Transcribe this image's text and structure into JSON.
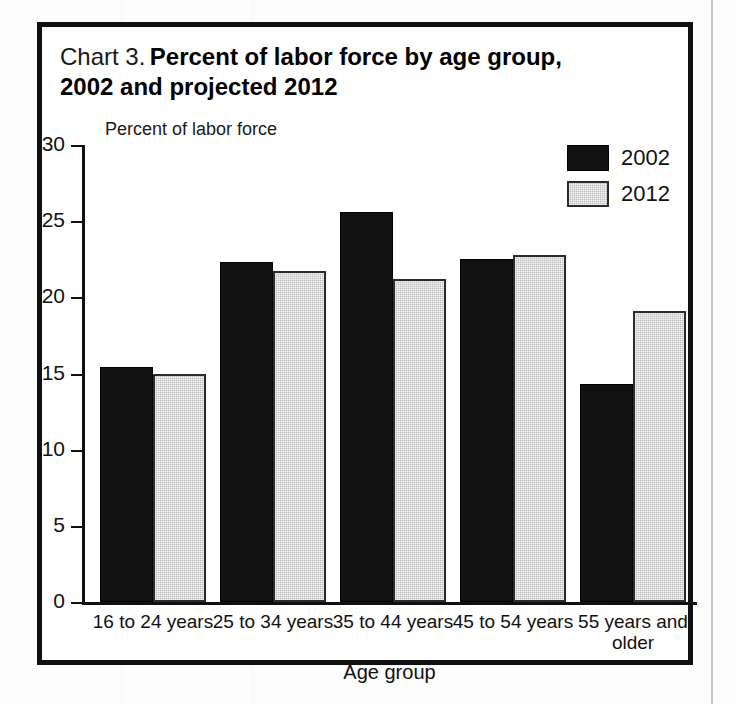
{
  "figure": {
    "title_prefix": "Chart 3.",
    "title_main": "Percent of labor force by age group,",
    "title_line2": "2002 and projected 2012",
    "y_axis_title": "Percent of labor force",
    "x_axis_title": "Age group"
  },
  "legend": {
    "position": "top-right",
    "entries": [
      {
        "label": "2002",
        "color": "#111111"
      },
      {
        "label": "2012",
        "color": "#bdbdbd"
      }
    ]
  },
  "chart_data": {
    "type": "bar",
    "title": "Chart 3. Percent of labor force by age group, 2002 and projected 2012",
    "xlabel": "Age group",
    "ylabel": "Percent of labor force",
    "ylim": [
      0,
      30
    ],
    "yticks": [
      0,
      5,
      10,
      15,
      20,
      25,
      30
    ],
    "ytick_labels": [
      "0",
      "5",
      "10",
      "15",
      "20",
      "25",
      "30"
    ],
    "grid": false,
    "legend_position": "top-right",
    "categories": [
      "16 to 24 years",
      "25 to 34 years",
      "35 to 44 years",
      "45 to 54 years",
      "55 years and older"
    ],
    "category_lines": [
      [
        "16 to 24 years"
      ],
      [
        "25 to 34 years"
      ],
      [
        "35 to 44 years"
      ],
      [
        "45 to 54 years"
      ],
      [
        "55 years and",
        "older"
      ]
    ],
    "series": [
      {
        "name": "2002",
        "color": "#111111",
        "values": [
          15.4,
          22.3,
          25.6,
          22.5,
          14.3
        ]
      },
      {
        "name": "2012",
        "color": "#bdbdbd",
        "values": [
          15.0,
          21.7,
          21.2,
          22.8,
          19.1
        ]
      }
    ]
  }
}
